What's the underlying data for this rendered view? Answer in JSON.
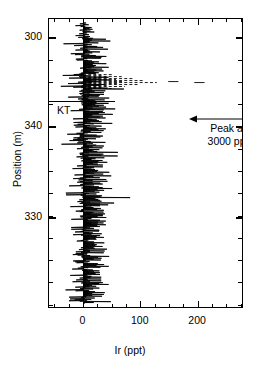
{
  "figure": {
    "background": "#ffffff",
    "ink": "#000000"
  },
  "axes": {
    "x": {
      "title": "Ir (ppt)",
      "ticks": [
        {
          "value": 0,
          "label": "0"
        },
        {
          "value": 100,
          "label": "100"
        },
        {
          "value": 200,
          "label": "200"
        }
      ],
      "minor_step": 25,
      "range": [
        -60,
        280
      ]
    },
    "y": {
      "title": "Position (m)",
      "ticks": [
        {
          "value": 300,
          "label": "300"
        },
        {
          "value": 340,
          "label": "340"
        },
        {
          "value": 330,
          "label": "330"
        }
      ],
      "tick_pixels": [
        37,
        126,
        217
      ],
      "minor_count": 13
    }
  },
  "markers": {
    "kt": {
      "label": "KT",
      "boundary_pixel_y": 82
    }
  },
  "annotation": {
    "line1": "Peak at",
    "line2": "3000 ppt",
    "arrow": "left-arrow-icon"
  },
  "chart_data": {
    "type": "line",
    "orientation": "horizontal-stem-profile",
    "title": "",
    "xlabel": "Ir (ppt)",
    "ylabel": "Position (m)",
    "xlim": [
      -60,
      280
    ],
    "ylim_pixels": [
      18,
      308
    ],
    "grid": false,
    "legend": null,
    "series": [
      {
        "name": "Ir concentration profile",
        "note": "Dense horizontal spike trace of Ir (ppt) versus stratigraphic position (m); baseline near 0 ppt, noise band roughly -25 to +55 ppt, with an anomaly at the KT boundary reaching off-scale 3000 ppt.",
        "baseline_value": 0,
        "noise_min": -28,
        "noise_max": 58,
        "values": [
          12,
          4,
          30,
          8,
          22,
          3,
          41,
          9,
          18,
          6,
          33,
          11,
          25,
          2,
          37,
          14,
          20,
          7,
          29,
          5,
          44,
          10,
          16,
          3,
          35,
          12,
          23,
          6,
          39,
          8,
          27,
          4,
          31,
          13,
          19,
          5,
          42,
          9,
          24,
          2,
          36,
          15,
          21,
          7,
          28,
          4,
          40,
          11,
          17,
          6,
          34,
          10,
          26,
          3,
          38,
          13,
          22,
          5,
          45,
          8,
          30,
          12,
          18,
          4,
          32,
          9,
          25,
          6,
          43,
          14,
          20,
          3,
          37,
          11,
          28,
          7,
          35,
          5,
          41,
          10,
          23,
          2,
          39,
          13,
          19,
          6,
          31,
          9,
          26,
          4,
          44,
          12,
          21,
          8,
          33,
          5,
          29,
          3,
          47,
          15,
          17,
          7,
          36,
          10,
          24,
          6,
          42,
          11,
          20,
          4,
          38,
          13,
          27,
          9,
          32,
          5,
          46,
          14,
          18,
          3,
          40,
          12,
          25,
          8,
          34,
          6,
          43,
          10,
          22,
          4,
          37,
          16,
          19,
          7,
          30,
          9,
          48,
          13,
          23,
          5,
          41,
          11,
          28,
          6,
          35,
          3,
          45,
          15,
          21,
          8,
          33,
          10,
          26,
          4,
          39,
          12,
          17,
          7,
          44,
          14,
          24,
          5,
          36,
          9,
          31,
          6,
          49,
          13,
          20,
          3,
          42,
          11,
          27,
          8,
          38,
          5,
          32,
          10,
          46,
          16,
          18,
          4,
          40,
          12,
          29,
          7,
          35,
          9,
          23,
          6,
          47,
          14,
          21,
          5,
          43,
          11,
          30,
          8,
          37,
          3,
          25,
          10,
          50,
          15,
          19,
          6,
          41,
          13,
          28,
          4,
          34,
          9,
          45,
          12,
          22,
          7,
          39,
          5,
          31,
          11,
          26,
          8,
          48,
          16,
          20,
          3,
          44,
          14,
          27,
          6,
          36,
          10,
          24,
          9,
          42,
          5,
          33,
          12,
          29,
          7
        ],
        "anomaly": {
          "position_label": "KT",
          "peak_value": 3000,
          "peak_display": "off-scale, arrow annotated",
          "dashed_tail_max": 160
        }
      }
    ]
  }
}
